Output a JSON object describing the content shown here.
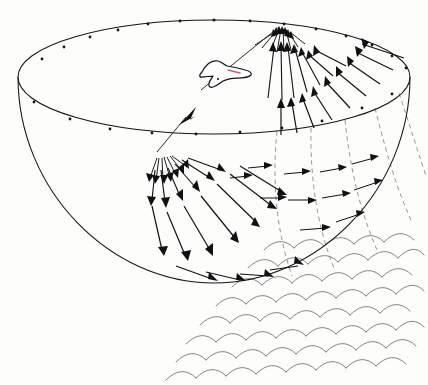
{
  "figure": {
    "kind": "scientific-line-illustration",
    "title": "Hemispherical wave field with gull above water surface",
    "background_color": "#fdfdfb",
    "width": 428,
    "height": 385,
    "ink_color": "#141414",
    "dashed_color": "#8a8a8a",
    "wave_color": "#6f6f6f",
    "accent_color": "#c4616b"
  },
  "dome": {
    "label": "hemisphere",
    "rim_ellipse": {
      "center_x": 214,
      "center_y": 77,
      "radius_x": 196,
      "radius_y": 57
    },
    "bowl_bottom_y": 283,
    "tick_count": 22,
    "tick_label": "rim-graduation-dot"
  },
  "bird": {
    "label": "gull",
    "center_x": 224,
    "center_y": 76,
    "body_color": "#ffffff",
    "outline_color": "#141414",
    "beak_color": "#c4616b"
  },
  "sources": [
    {
      "id": "upper-source",
      "label": "upper radiation point",
      "x": 281,
      "y": 25,
      "ray_count": 26,
      "direction": "arrows point inward toward the source"
    },
    {
      "id": "lower-source",
      "label": "lower radiation point",
      "x": 156,
      "y": 154,
      "ray_count": 26,
      "direction": "arrows point outward away from the source"
    }
  ],
  "main_ray": {
    "label": "incident ray between sources",
    "from_x": 281,
    "from_y": 25,
    "to_x": 156,
    "to_y": 154,
    "arrow_at": {
      "x": 186,
      "y": 126
    },
    "arrow_direction": "down-left"
  },
  "meridians": {
    "label": "dashed meridian curves",
    "count": 5,
    "style": "dashed"
  },
  "waves": {
    "label": "scalloped water surface",
    "rows": 8,
    "arcs_per_row": 9,
    "orientation": "diagonal, lower-left to upper-right"
  },
  "chart_data": {
    "type": "scatter",
    "title": "Hemispherical wave field with gull above water surface",
    "xlabel": "",
    "ylabel": "",
    "annotations": [
      "upper radiation point at rim",
      "lower radiation point inside bowl",
      "incident ray from upper to lower point",
      "gull in flight",
      "scalloped water-surface wavelets"
    ]
  }
}
